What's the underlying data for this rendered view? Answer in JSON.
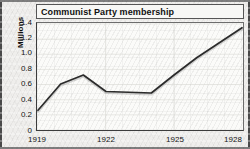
{
  "figure": {
    "title": "Communist Party membership",
    "y_axis_title": "Millions",
    "frame_color": "#4a4a4a",
    "line_color": "#2b2b2b",
    "background_color": "#efeeec"
  },
  "chart_data": {
    "type": "line",
    "title": "Communist Party membership",
    "xlabel": "",
    "ylabel": "Millions",
    "xlim": [
      1919,
      1928
    ],
    "ylim": [
      0,
      1.4
    ],
    "grid": true,
    "legend": "none",
    "x_tick_labels": [
      "1919",
      "1922",
      "1925",
      "1928"
    ],
    "x_ticks": [
      1919,
      1922,
      1925,
      1928
    ],
    "y_tick_labels": [
      "0",
      "0.2",
      "0.4",
      "0.6",
      "0.8",
      "1.0",
      "1.2",
      "1.4"
    ],
    "y_ticks": [
      0,
      0.2,
      0.4,
      0.6,
      0.8,
      1.0,
      1.2,
      1.4
    ],
    "series": [
      {
        "name": "Communist Party membership",
        "x": [
          1919,
          1920,
          1921,
          1922,
          1923,
          1924,
          1925,
          1926,
          1927,
          1928
        ],
        "values": [
          0.25,
          0.6,
          0.72,
          0.5,
          0.49,
          0.48,
          0.72,
          0.95,
          1.15,
          1.35
        ]
      }
    ]
  }
}
